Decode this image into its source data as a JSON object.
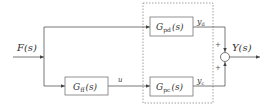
{
  "diagram": {
    "type": "block_diagram",
    "input": {
      "label": "F(s)"
    },
    "blocks": [
      {
        "id": "gff",
        "name": "G",
        "sub": "ff",
        "arg": "(s)"
      },
      {
        "id": "gpd",
        "name": "G",
        "sub": "pd",
        "arg": "(s)"
      },
      {
        "id": "gpc",
        "name": "G",
        "sub": "pc",
        "arg": "(s)"
      }
    ],
    "signals": {
      "u": "u",
      "yd": {
        "name": "y",
        "sub": "d"
      },
      "yc": {
        "name": "y",
        "sub": "c"
      }
    },
    "summer": {
      "sign_top": "+",
      "sign_bottom": "+"
    },
    "output": {
      "label": "Y(s)"
    },
    "colors": {
      "line": "#555555",
      "dashed": "#888888",
      "box_fill": "#ffffff"
    }
  }
}
